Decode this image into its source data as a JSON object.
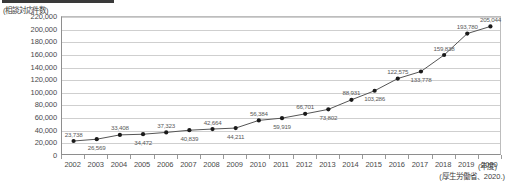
{
  "figure": {
    "top_clip_bar": "",
    "y_axis_unit_label": "(相談対応件数)",
    "x_axis_title": "(年度)",
    "source_note": "(厚生労働省、2020.)",
    "line_color": "#555555",
    "marker_color": "#1a1a1a",
    "grid_color": "#cfcfcf",
    "axis_color": "#8e8e8e"
  },
  "chart_data": {
    "type": "line",
    "title": "",
    "subtitle": "",
    "xlabel": "(年度)",
    "ylabel": "(相談対応件数)",
    "ylim": [
      0,
      220000
    ],
    "ytick_step": 20000,
    "grid": true,
    "legend": "none",
    "annotation": "(厚生労働省、2020.)",
    "ytick_labels": [
      "0",
      "20,000",
      "40,000",
      "60,000",
      "80,000",
      "100,000",
      "120,000",
      "140,000",
      "160,000",
      "180,000",
      "200,000",
      "220,000"
    ],
    "ytick_values": [
      0,
      20000,
      40000,
      60000,
      80000,
      100000,
      120000,
      140000,
      160000,
      180000,
      200000,
      220000
    ],
    "categories": [
      "2002",
      "2003",
      "2004",
      "2005",
      "2006",
      "2007",
      "2008",
      "2009",
      "2010",
      "2011",
      "2012",
      "2013",
      "2014",
      "2015",
      "2016",
      "2017",
      "2018",
      "2019",
      "2020"
    ],
    "values": [
      23738,
      26569,
      33408,
      34472,
      37323,
      40839,
      42664,
      44211,
      56384,
      59919,
      66701,
      73802,
      88931,
      103286,
      122575,
      133778,
      159838,
      193780,
      205044
    ],
    "data_labels": [
      "23,738",
      "26,569",
      "33,408",
      "34,472",
      "37,323",
      "40,839",
      "42,664",
      "44,211",
      "56,384",
      "59,919",
      "66,701",
      "73,802",
      "88,931",
      "103,286",
      "122,575",
      "133,778",
      "159,838",
      "193,780",
      "205,044"
    ],
    "label_positions": [
      "above",
      "below",
      "above",
      "below",
      "above",
      "below",
      "above",
      "below",
      "above",
      "below",
      "above",
      "below",
      "above",
      "below",
      "above",
      "below",
      "above",
      "above",
      "above"
    ]
  }
}
